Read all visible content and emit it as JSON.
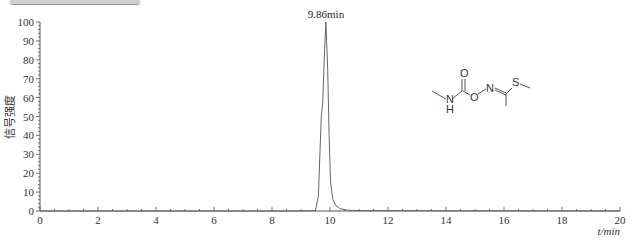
{
  "chart_data": {
    "type": "line",
    "title": "",
    "xlabel": "t/min",
    "ylabel": "信号强度",
    "xlim": [
      0,
      20
    ],
    "ylim": [
      0,
      100
    ],
    "x_ticks": [
      "0",
      "2",
      "4",
      "6",
      "8",
      "10",
      "12",
      "14",
      "16",
      "18",
      "20"
    ],
    "y_ticks": [
      "0",
      "10",
      "20",
      "30",
      "40",
      "50",
      "60",
      "70",
      "80",
      "90",
      "100"
    ],
    "grid": false,
    "legend": null,
    "annotations": [
      {
        "text": "9.86min",
        "x": 9.86,
        "y": 100
      }
    ],
    "series": [
      {
        "name": "chromatogram",
        "x": [
          0,
          9.0,
          9.5,
          9.6,
          9.65,
          9.7,
          9.75,
          9.8,
          9.86,
          9.92,
          9.97,
          10.02,
          10.1,
          10.2,
          10.35,
          10.6,
          11.0,
          20
        ],
        "values": [
          0,
          0,
          0.3,
          8,
          30,
          50,
          58,
          80,
          100,
          75,
          40,
          15,
          6,
          3,
          1.2,
          0.5,
          0.2,
          0
        ]
      }
    ],
    "inset": {
      "type": "chemical-structure",
      "atoms_labels": [
        "O",
        "N",
        "H",
        "O",
        "N",
        "S"
      ],
      "description": "methomyl-like carbamate oxime structure"
    }
  },
  "labels": {
    "peak": "9.86min",
    "x_axis_title": "t/min",
    "y_axis_title": "信号强度",
    "x_ticks": [
      "0",
      "2",
      "4",
      "6",
      "8",
      "10",
      "12",
      "14",
      "16",
      "18",
      "20"
    ],
    "y_ticks": [
      "0",
      "10",
      "20",
      "30",
      "40",
      "50",
      "60",
      "70",
      "80",
      "90",
      "100"
    ],
    "struct": {
      "o_carbonyl": "O",
      "n_amide": "N",
      "h_amide": "H",
      "o_ester": "O",
      "n_oxime": "N",
      "s": "S"
    }
  }
}
